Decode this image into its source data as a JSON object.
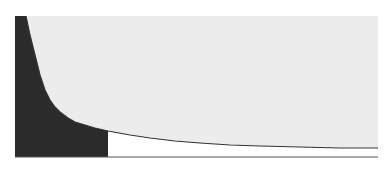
{
  "figure": {
    "type": "decay-curve-area-diagram",
    "colors": {
      "background": "#ffffff",
      "above_curve": "#ececec",
      "shaded_region": "#2b2b2b",
      "unshaded_region": "#ffffff",
      "curve": "#333333",
      "baseline": "#555555"
    },
    "plot_area": {
      "x0": 15,
      "y0": 16,
      "x1": 378,
      "y1": 157
    },
    "shaded_cutoff_x": 108,
    "curve_points": [
      [
        26,
        16
      ],
      [
        30,
        35
      ],
      [
        35,
        55
      ],
      [
        40,
        75
      ],
      [
        45,
        90
      ],
      [
        50,
        100
      ],
      [
        55,
        107
      ],
      [
        60,
        112
      ],
      [
        68,
        118
      ],
      [
        75,
        122
      ],
      [
        85,
        125
      ],
      [
        95,
        128
      ],
      [
        108,
        131
      ],
      [
        130,
        135
      ],
      [
        150,
        138
      ],
      [
        175,
        141
      ],
      [
        200,
        143
      ],
      [
        230,
        145
      ],
      [
        260,
        146
      ],
      [
        300,
        147
      ],
      [
        340,
        148
      ],
      [
        378,
        148
      ]
    ]
  }
}
